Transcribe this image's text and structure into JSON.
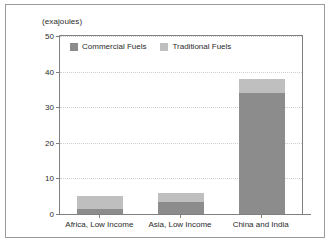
{
  "chart_data": {
    "type": "bar",
    "subtype": "stacked-bar",
    "title": "",
    "axis_unit_label": "(exajoules)",
    "xlabel": "",
    "ylabel": "",
    "ylim": [
      0,
      50
    ],
    "yticks": [
      0,
      10,
      20,
      30,
      40,
      50
    ],
    "ytick_labels": [
      "0",
      "10",
      "20",
      "30",
      "40",
      "50"
    ],
    "grid": true,
    "legend_position": "top-left-inside",
    "categories": [
      "Africa, Low Income",
      "Asia, Low Income",
      "China and India"
    ],
    "series": [
      {
        "name": "Commercial Fuels",
        "color": "#8c8c8c",
        "values": [
          1.5,
          3.3,
          34
        ]
      },
      {
        "name": "Traditional Fuels",
        "color": "#bfbfbf",
        "values": [
          3.5,
          2.7,
          4
        ]
      }
    ],
    "totals": [
      5,
      6,
      38
    ]
  },
  "legend": {
    "items": [
      {
        "label": "Commercial Fuels",
        "color": "#8c8c8c"
      },
      {
        "label": "Traditional Fuels",
        "color": "#bfbfbf"
      }
    ]
  }
}
